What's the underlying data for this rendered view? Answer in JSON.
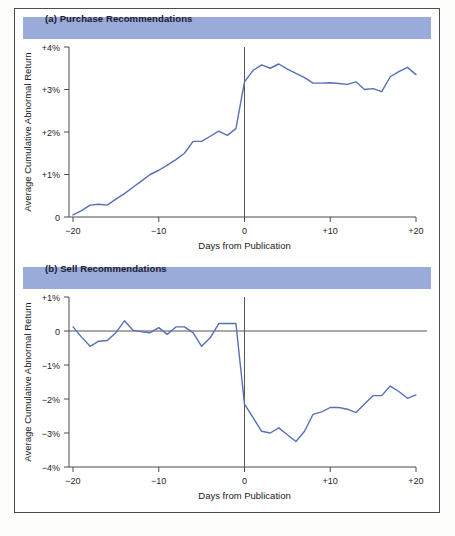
{
  "figure": {
    "background_color": "#ffffff",
    "border_color": "#4c4c4c",
    "header_band_color": "#9aaad9",
    "line_color": "#5570b5"
  },
  "panel_a": {
    "title": "(a) Purchase Recommendations",
    "xlabel": "Days from Publication",
    "ylabel": "Average Cumulative Abnormal Return",
    "x_ticks": [
      "−20",
      "−10",
      "0",
      "+10",
      "+20"
    ],
    "y_ticks": [
      "0",
      "+1%",
      "+2%",
      "+3%",
      "+4%"
    ]
  },
  "panel_b": {
    "title": "(b) Sell Recommendations",
    "xlabel": "Days from Publication",
    "ylabel": "Average Cumulative Abnormal Return",
    "x_ticks": [
      "−20",
      "−10",
      "0",
      "+10",
      "+20"
    ],
    "y_ticks": [
      "−4%",
      "−3%",
      "−2%",
      "−1%",
      "0",
      "+1%"
    ]
  },
  "chart_data": [
    {
      "type": "line",
      "title": "(a) Purchase Recommendations",
      "xlabel": "Days from Publication",
      "ylabel": "Average Cumulative Abnormal Return",
      "xlim": [
        -20,
        20
      ],
      "ylim": [
        0,
        4
      ],
      "x_ticks": [
        -20,
        -10,
        0,
        10,
        20
      ],
      "y_ticks": [
        0,
        1,
        2,
        3,
        4
      ],
      "y_tick_labels": [
        "0",
        "+1%",
        "+2%",
        "+3%",
        "+4%"
      ],
      "grid": false,
      "legend": "none",
      "annotations": [
        "vertical event line at day 0"
      ],
      "x": [
        -20,
        -19,
        -18,
        -17,
        -16,
        -15,
        -14,
        -13,
        -12,
        -11,
        -10,
        -9,
        -8,
        -7,
        -6,
        -5,
        -4,
        -3,
        -2,
        -1,
        0,
        1,
        2,
        3,
        4,
        5,
        6,
        7,
        8,
        9,
        10,
        11,
        12,
        13,
        14,
        15,
        16,
        17,
        18,
        19,
        20
      ],
      "y": [
        0.05,
        0.15,
        0.28,
        0.3,
        0.28,
        0.42,
        0.55,
        0.7,
        0.85,
        1.0,
        1.1,
        1.22,
        1.35,
        1.5,
        1.78,
        1.78,
        1.9,
        2.02,
        1.92,
        2.08,
        3.18,
        3.45,
        3.58,
        3.5,
        3.6,
        3.48,
        3.38,
        3.28,
        3.15,
        3.15,
        3.16,
        3.14,
        3.12,
        3.18,
        3.0,
        3.02,
        2.95,
        3.3,
        3.42,
        3.52,
        3.35
      ]
    },
    {
      "type": "line",
      "title": "(b) Sell Recommendations",
      "xlabel": "Days from Publication",
      "ylabel": "Average Cumulative Abnormal Return",
      "xlim": [
        -20,
        20
      ],
      "ylim": [
        -4,
        1
      ],
      "x_ticks": [
        -20,
        -10,
        0,
        10,
        20
      ],
      "y_ticks": [
        -4,
        -3,
        -2,
        -1,
        0,
        1
      ],
      "y_tick_labels": [
        "−4%",
        "−3%",
        "−2%",
        "−1%",
        "0",
        "+1%"
      ],
      "grid": false,
      "legend": "none",
      "annotations": [
        "vertical event line at day 0",
        "horizontal zero reference line"
      ],
      "x": [
        -20,
        -19,
        -18,
        -17,
        -16,
        -15,
        -14,
        -13,
        -12,
        -11,
        -10,
        -9,
        -8,
        -7,
        -6,
        -5,
        -4,
        -3,
        -2,
        -1,
        0,
        1,
        2,
        3,
        4,
        5,
        6,
        7,
        8,
        9,
        10,
        11,
        12,
        13,
        14,
        15,
        16,
        17,
        18,
        19,
        20
      ],
      "y": [
        0.12,
        -0.18,
        -0.45,
        -0.3,
        -0.28,
        -0.05,
        0.3,
        0.02,
        -0.02,
        -0.05,
        0.1,
        -0.1,
        0.12,
        0.12,
        -0.05,
        -0.45,
        -0.2,
        0.22,
        0.22,
        0.22,
        -2.15,
        -2.55,
        -2.95,
        -3.0,
        -2.85,
        -3.05,
        -3.25,
        -2.95,
        -2.45,
        -2.38,
        -2.25,
        -2.25,
        -2.3,
        -2.4,
        -2.15,
        -1.9,
        -1.9,
        -1.62,
        -1.78,
        -1.98,
        -1.88
      ]
    }
  ]
}
